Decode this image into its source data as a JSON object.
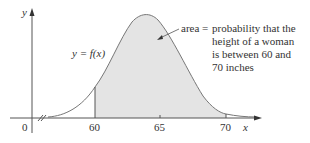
{
  "diagram": {
    "axis_labels": {
      "x": "x",
      "y": "y",
      "origin": "0"
    },
    "ticks": [
      {
        "value": "60",
        "px": 95
      },
      {
        "value": "65",
        "px": 160
      },
      {
        "value": "70",
        "px": 226
      }
    ],
    "curve_label": "y = f(x)",
    "annotation": {
      "prefix": "area =",
      "lines": [
        "probability that the",
        "height of a woman",
        "is between 60 and",
        "70 inches"
      ]
    },
    "colors": {
      "shade": "#e4e4e4",
      "curve": "#777777",
      "axis": "#555555",
      "text": "#333333"
    }
  }
}
